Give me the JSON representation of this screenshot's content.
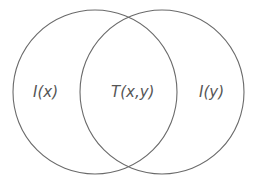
{
  "diagram": {
    "type": "venn",
    "stroke_color": "#666666",
    "text_color": "#555555",
    "sets": [
      {
        "id": "left",
        "cx": 95,
        "cy": 92,
        "r": 82
      },
      {
        "id": "right",
        "cx": 162,
        "cy": 92,
        "r": 82
      }
    ],
    "labels": {
      "left_only": "I(x)",
      "intersection": "T(x,y)",
      "right_only": "I(y)"
    }
  }
}
